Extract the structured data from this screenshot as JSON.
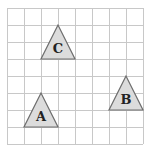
{
  "grid": {
    "origin_x": 7,
    "origin_y": 8,
    "cell": 17,
    "cols": 8,
    "rows": 8,
    "line_color": "#c8c8c8"
  },
  "triangles": [
    {
      "label": "C",
      "apex": [
        3,
        1
      ],
      "base_left": [
        2,
        3
      ],
      "base_right": [
        4,
        3
      ]
    },
    {
      "label": "B",
      "apex": [
        7,
        4
      ],
      "base_left": [
        6,
        6
      ],
      "base_right": [
        8,
        6
      ]
    },
    {
      "label": "A",
      "apex": [
        2,
        5
      ],
      "base_left": [
        1,
        7
      ],
      "base_right": [
        3,
        7
      ]
    }
  ],
  "style": {
    "triangle_fill": "#dcdcdc",
    "triangle_stroke": "#6e6e6e",
    "label_color": "#222222"
  }
}
